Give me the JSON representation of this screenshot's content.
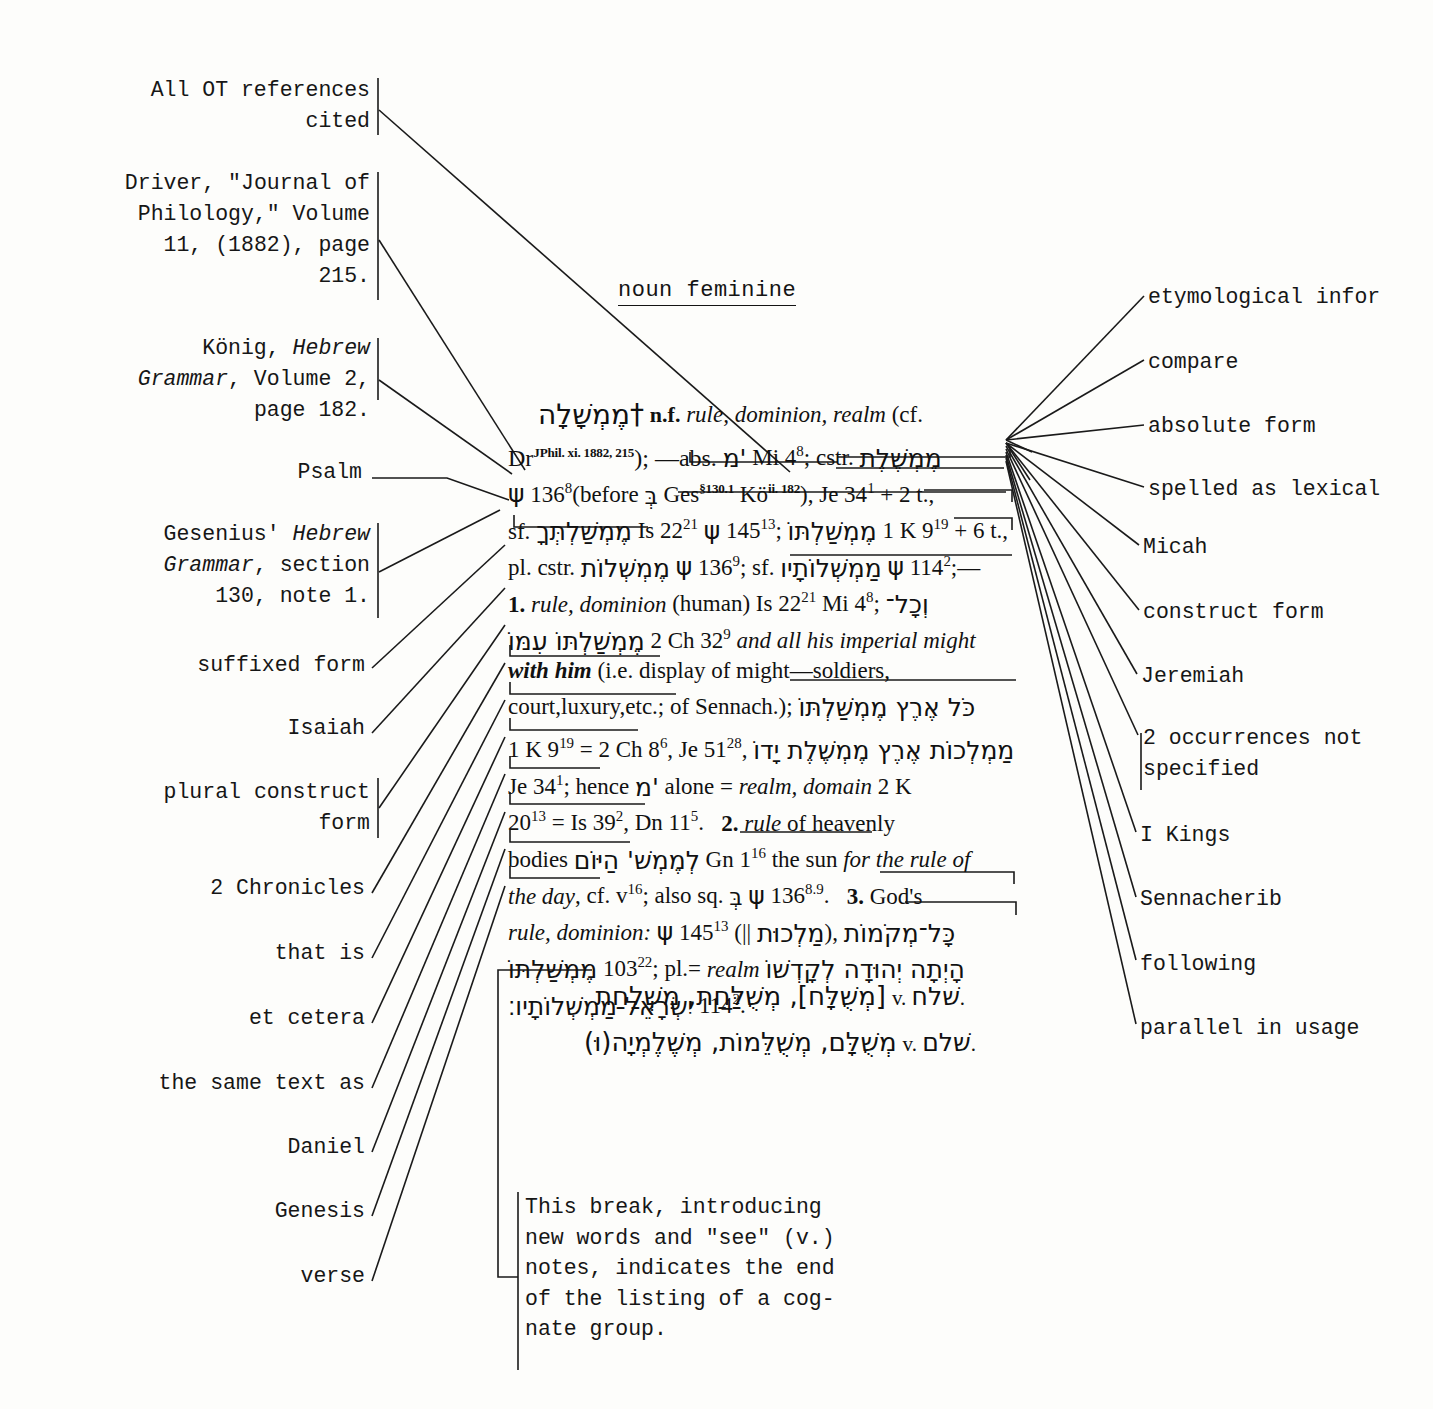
{
  "figure": {
    "part_of_speech_label": "noun feminine",
    "headword": "†מֶמְשָׁלָה",
    "headword_gloss": "n.f. rule, dominion, realm (cf."
  },
  "left_annotations": [
    {
      "id": "all-ot-references-cited",
      "lines": [
        "All OT references",
        "cited"
      ]
    },
    {
      "id": "driver-journal-of-philology",
      "lines": [
        "Driver, \"Journal of",
        "Philology,\" Volume",
        "11, (1882), page",
        "215."
      ]
    },
    {
      "id": "konig-hebrew-grammar",
      "lines": [
        "König, Hebrew",
        "Grammar, Volume 2,",
        "page 182."
      ],
      "italic_words": [
        "Hebrew",
        "Grammar"
      ]
    },
    {
      "id": "psalm",
      "lines": [
        "Psalm"
      ]
    },
    {
      "id": "gesenius-hebrew-grammar",
      "lines": [
        "Gesenius' Hebrew",
        "Grammar, section",
        "130, note 1."
      ],
      "italic_words": [
        "Hebrew",
        "Grammar"
      ]
    },
    {
      "id": "suffixed-form",
      "lines": [
        "suffixed form"
      ]
    },
    {
      "id": "isaiah",
      "lines": [
        "Isaiah"
      ]
    },
    {
      "id": "plural-construct-form",
      "lines": [
        "plural construct",
        "form"
      ]
    },
    {
      "id": "2-chronicles",
      "lines": [
        "2 Chronicles"
      ]
    },
    {
      "id": "that-is",
      "lines": [
        "that is"
      ]
    },
    {
      "id": "et-cetera",
      "lines": [
        "et cetera"
      ]
    },
    {
      "id": "the-same-text-as",
      "lines": [
        "the same text as"
      ]
    },
    {
      "id": "daniel",
      "lines": [
        "Daniel"
      ]
    },
    {
      "id": "genesis",
      "lines": [
        "Genesis"
      ]
    },
    {
      "id": "verse",
      "lines": [
        "verse"
      ]
    }
  ],
  "right_annotations": [
    {
      "id": "etymological-information",
      "lines": [
        "etymological infor"
      ]
    },
    {
      "id": "compare",
      "lines": [
        "compare"
      ]
    },
    {
      "id": "absolute-form",
      "lines": [
        "absolute form"
      ]
    },
    {
      "id": "spelled-as-lexical",
      "lines": [
        "spelled as lexical"
      ]
    },
    {
      "id": "micah",
      "lines": [
        "Micah"
      ]
    },
    {
      "id": "construct-form",
      "lines": [
        "construct form"
      ]
    },
    {
      "id": "jeremiah",
      "lines": [
        "Jeremiah"
      ]
    },
    {
      "id": "2-occurrences-not-specified",
      "lines": [
        "2 occurrences not",
        "specified"
      ]
    },
    {
      "id": "i-kings",
      "lines": [
        "I Kings"
      ]
    },
    {
      "id": "sennacherib",
      "lines": [
        "Sennacherib"
      ]
    },
    {
      "id": "following",
      "lines": [
        "following"
      ]
    },
    {
      "id": "parallel-in-usage",
      "lines": [
        "parallel in usage "
      ]
    }
  ],
  "article_lines": [
    "†מֶמְשָׁלָה n.f. rule, dominion, realm (cf.",
    "Dr JPhil. xi. 1882, 215 ); —abs. 'מ Mi 4⁸; cstr. מֶמְשֶׁלֶת",
    "ψ 136⁸ (before בְּ Ges §130.1 Kö ii. 182 ), Je 34¹ + 2 t.,",
    "sf. מֶמְשַׁלְתְּךָ Is 22²¹ ψ 145¹³; מֶמְשַׁלְתּוֹ 1 K 9¹⁹ + 6 t.,",
    "pl. cstr. מֶמְשְׁלוֹת ψ 136⁹; sf. מַמְשְׁלוֹתָיו ψ 114²; —",
    "1. rule, dominion (human) Is 22²¹ Mi 4⁸; וְכָל־",
    "מֶמְשַׁלְתּוֹ עִמּוֹ 2 Ch 32⁹ and all his imperial might",
    "with him (i.e. display of might — soldiers,",
    "court, luxury, etc.; of Sennach.); כֹּל אֶרֶץ מֶמְשַׁלְתּוֹ",
    "1 K 9¹⁹ = 2 Ch 8⁶, Je 51²⁸, מַמְלְכוֹת אֶרֶץ מֶמְשֶׁלֶת יָדוֹ",
    "Je 34¹; hence 'מ alone = realm, domain 2 K",
    "20¹³ = Is 39², Dn 11⁵.   2. rule of heavenly",
    "bodies לְמֶמְשׁ' הַיּוֹם Gn 1¹⁶ the sun for the rule of",
    "the day, cf. v¹⁶; also sq. בְּ ψ 136⁸·⁹.   3. God's",
    "rule, dominion: ψ 145¹³ (|| מַלְכוּת), כָּל־מְקֹמוֹת",
    "מֶמְשַׁלְתּוֹ 103²²; pl. = realm הָיְתָה יְהוּדָה לְקָדְשׁוֹ",
    "יִשְׂרָאֵל מַמְשְׁלוֹתָיו׃ 114²."
  ],
  "see_notes": [
    {
      "hebrew": "[מְשֻׁלָּח], מְשֻׁלַּחַת, מִשְׁלַחַת",
      "see": "v. שׁלח."
    },
    {
      "hebrew": "מְשֻׁלָּם, מְשֻׁלֵּמוֹת, מְשֶׁלֶמְיָה(וּ)",
      "see": "v. שׁלם."
    }
  ],
  "break_note": [
    "This break, introducing",
    "new words and \"see\" (v.)",
    "notes, indicates the end",
    "of the listing of a cog-",
    "nate group."
  ],
  "colors": {
    "ink": "#141414",
    "paper": "#fdfdfb",
    "leader": "#1a1a1a"
  }
}
